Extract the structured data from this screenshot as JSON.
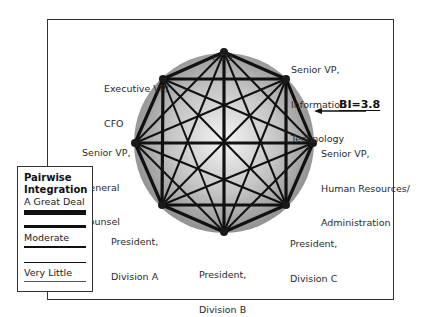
{
  "diagram": {
    "title": "Pairwise Integration",
    "bi_label": "BI=3.8",
    "nodes": [
      {
        "id": "ceo",
        "label_lines": [
          "CEO"
        ]
      },
      {
        "id": "cfo",
        "label_lines": [
          "Executive VP/",
          "CFO"
        ]
      },
      {
        "id": "it",
        "label_lines": [
          "Senior VP,",
          "Information",
          "Technology"
        ]
      },
      {
        "id": "gc",
        "label_lines": [
          "Senior VP,",
          "General",
          "Counsel"
        ]
      },
      {
        "id": "hr",
        "label_lines": [
          "Senior VP,",
          "Human Resources/",
          "Administration"
        ]
      },
      {
        "id": "divA",
        "label_lines": [
          "President,",
          "Division A"
        ]
      },
      {
        "id": "divB",
        "label_lines": [
          "President,",
          "Division B"
        ]
      },
      {
        "id": "divC",
        "label_lines": [
          "President,",
          "Division C"
        ]
      }
    ],
    "legend": {
      "title_line1": "Pairwise",
      "title_line2": "Integration",
      "levels": [
        {
          "label": "A Great Deal"
        },
        {
          "label": "Moderate"
        },
        {
          "label": "Very Little"
        }
      ]
    },
    "colors": {
      "edge": "#111111",
      "sphere_light": "#f2f2f2",
      "sphere_dark": "#8a8a8a",
      "frame": "#333333"
    }
  }
}
